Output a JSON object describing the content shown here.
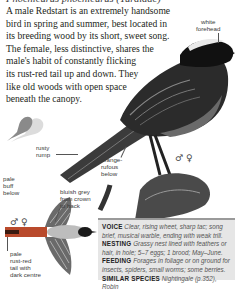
{
  "header": {
    "latin_name": "Phoenicurus phoenicurus (Turdidae)"
  },
  "intro": {
    "lines": [
      "A male Redstart is an extremely handsome",
      "bird in spring and summer, best located in",
      "its breeding wood by its short, sweet song.",
      "The female, less distinctive, shares the",
      "male's habit of constantly flicking",
      "its rust-red tail up and down. They",
      "like old woods with open space",
      "beneath the canopy."
    ]
  },
  "illustration_labels": {
    "white_forehead": [
      "white",
      "forehead"
    ],
    "rusty_rump": [
      "rusty",
      "rump"
    ],
    "orange_rufous_below": [
      "orange-",
      "rufous",
      "below"
    ],
    "pale_buff_below": [
      "pale",
      "buff",
      "below"
    ],
    "bluish_grey": [
      "bluish grey",
      "from crown",
      "to back"
    ],
    "pale_rust_tail": [
      "pale",
      "rust-red",
      "tail with",
      "dark centre"
    ]
  },
  "symbols": {
    "perched_sex": "♂ ♀",
    "flight_sex": "♂ ♀"
  },
  "icons": {
    "size_silhouette": "bird-silhouette-size-comparison"
  },
  "infobox": {
    "rows": [
      {
        "heading": "VOICE",
        "lines": [
          "Clear, rising wheet, sharp tac; song",
          "brief, musical warble, ending with weak trill."
        ]
      },
      {
        "heading": "NESTING",
        "lines": [
          "Grassy nest lined with feathers or",
          "hair, in hole; 5–7 eggs; 1 brood; May–June."
        ]
      },
      {
        "heading": "FEEDING",
        "lines": [
          "Forages in foliage or on ground for",
          "insects, spiders, small worms; some berries."
        ]
      },
      {
        "heading": "SIMILAR SPECIES",
        "lines": [
          "Nightingale (p.352), Robin"
        ]
      }
    ]
  },
  "colors": {
    "text": "#231f20",
    "infobox_bg": "#e6e6e6",
    "infobox_border": "#9a9a9a",
    "silhouette_dark": "#8a8a8a",
    "silhouette_light": "#dcdcdc"
  }
}
